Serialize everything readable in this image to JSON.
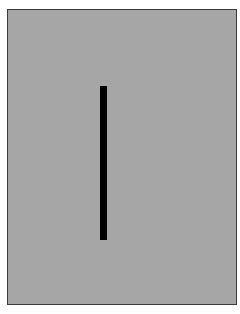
{
  "stimulus": {
    "frame": {
      "background_color": "#a6a6a6",
      "border_color": "#3a3a3a"
    },
    "bar": {
      "orientation": "vertical",
      "color": "#000000"
    }
  }
}
